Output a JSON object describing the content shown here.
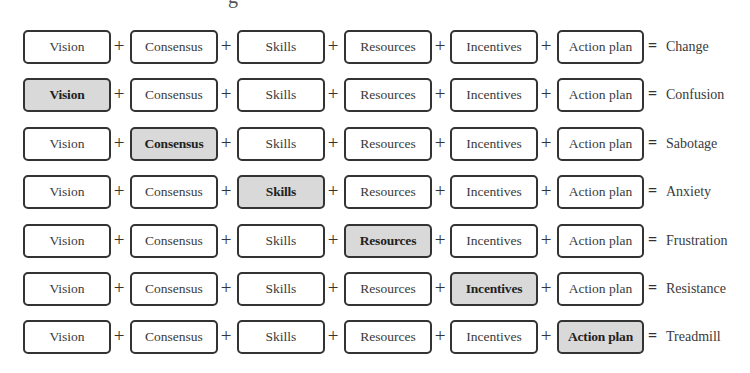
{
  "title_fragment": "g",
  "components": [
    "Vision",
    "Consensus",
    "Skills",
    "Resources",
    "Incentives",
    "Action plan"
  ],
  "operators": {
    "plus": "+",
    "equals": "="
  },
  "colors": {
    "box_border": "#333333",
    "box_fill": "#ffffff",
    "missing_fill": "#d9d9d9"
  },
  "rows": [
    {
      "missing": null,
      "result": "Change",
      "cells": [
        "Vision",
        "Consensus",
        "Skills",
        "Resources",
        "Incentives",
        "Action plan"
      ]
    },
    {
      "missing": "Vision",
      "result": "Confusion",
      "cells": [
        "Vision",
        "Consensus",
        "Skills",
        "Resources",
        "Incentives",
        "Action plan"
      ]
    },
    {
      "missing": "Consensus",
      "result": "Sabotage",
      "cells": [
        "Vision",
        "Consensus",
        "Skills",
        "Resources",
        "Incentives",
        "Action plan"
      ]
    },
    {
      "missing": "Skills",
      "result": "Anxiety",
      "cells": [
        "Vision",
        "Consensus",
        "Skills",
        "Resources",
        "Incentives",
        "Action plan"
      ]
    },
    {
      "missing": "Resources",
      "result": "Frustration",
      "cells": [
        "Vision",
        "Consensus",
        "Skills",
        "Resources",
        "Incentives",
        "Action plan"
      ]
    },
    {
      "missing": "Incentives",
      "result": "Resistance",
      "cells": [
        "Vision",
        "Consensus",
        "Skills",
        "Resources",
        "Incentives",
        "Action plan"
      ]
    },
    {
      "missing": "Action plan",
      "result": "Treadmill",
      "cells": [
        "Vision",
        "Consensus",
        "Skills",
        "Resources",
        "Incentives",
        "Action plan"
      ]
    }
  ]
}
